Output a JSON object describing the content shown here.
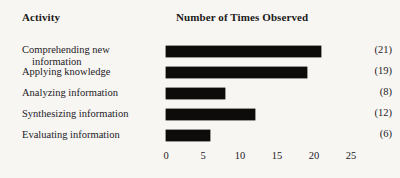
{
  "header": {
    "activity_label": "Activity",
    "measure_label": "Number of Times Observed"
  },
  "chart_data": {
    "type": "bar",
    "orientation": "horizontal",
    "title": "Number of Times Observed",
    "xlabel": "",
    "ylabel": "Activity",
    "categories": [
      "Comprehending new information",
      "Applying knowledge",
      "Analyzing information",
      "Synthesizing information",
      "Evaluating information"
    ],
    "values": [
      21,
      19,
      8,
      12,
      6
    ],
    "value_labels": [
      "(21)",
      "(19)",
      "(8)",
      "(12)",
      "(6)"
    ],
    "xlim": [
      0,
      25
    ],
    "xticks": [
      0,
      5,
      10,
      15,
      20,
      25
    ],
    "xtick_labels": [
      "0",
      "5",
      "10",
      "15",
      "20",
      "25"
    ],
    "grid": false,
    "legend": false,
    "bar_color": "#0d0c0b",
    "background_color": "#f7f6f3"
  },
  "rows": [
    {
      "label_line1": "Comprehending new",
      "label_line2": "information",
      "value_label": "(21)",
      "value": 21
    },
    {
      "label_line1": "Applying knowledge",
      "label_line2": "",
      "value_label": "(19)",
      "value": 19
    },
    {
      "label_line1": "Analyzing information",
      "label_line2": "",
      "value_label": "(8)",
      "value": 8
    },
    {
      "label_line1": "Synthesizing information",
      "label_line2": "",
      "value_label": "(12)",
      "value": 12
    },
    {
      "label_line1": "Evaluating information",
      "label_line2": "",
      "value_label": "(6)",
      "value": 6
    }
  ],
  "axis": {
    "ticks": [
      "0",
      "5",
      "10",
      "15",
      "20",
      "25"
    ]
  }
}
